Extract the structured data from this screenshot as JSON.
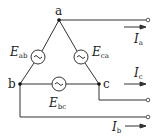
{
  "diagram": {
    "type": "three-phase delta-connected voltage source",
    "colors": {
      "line": "#333333",
      "background": "#ffffff"
    },
    "nodes": [
      {
        "id": "a",
        "label": "a",
        "x": 59,
        "y": 20
      },
      {
        "id": "b",
        "label": "b",
        "x": 20,
        "y": 84
      },
      {
        "id": "c",
        "label": "c",
        "x": 99,
        "y": 84
      }
    ],
    "sources": [
      {
        "id": "Eab",
        "symbol": "E",
        "subscript": "ab",
        "between": [
          "a",
          "b"
        ],
        "icon": "ac-source-icon"
      },
      {
        "id": "Eca",
        "symbol": "E",
        "subscript": "ca",
        "between": [
          "c",
          "a"
        ],
        "icon": "ac-source-icon"
      },
      {
        "id": "Ebc",
        "symbol": "E",
        "subscript": "bc",
        "between": [
          "b",
          "c"
        ],
        "icon": "ac-source-icon"
      }
    ],
    "currents": [
      {
        "id": "Ia",
        "symbol": "I",
        "subscript": "a",
        "line": "a",
        "direction": "right"
      },
      {
        "id": "Ic",
        "symbol": "I",
        "subscript": "c",
        "line": "c",
        "direction": "right"
      },
      {
        "id": "Ib",
        "symbol": "I",
        "subscript": "b",
        "line": "b",
        "direction": "right"
      }
    ],
    "terminals": [
      "a",
      "c",
      "b"
    ]
  }
}
